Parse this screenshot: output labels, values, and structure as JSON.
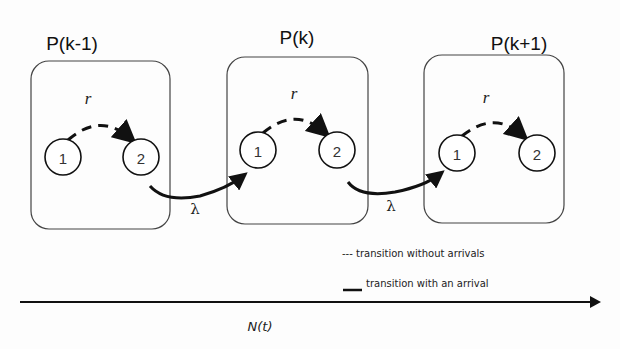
{
  "states": [
    {
      "title": "P(k-1)",
      "rate_label": "r",
      "nodes": [
        "1",
        "2"
      ]
    },
    {
      "title": "P(k)",
      "rate_label": "r",
      "nodes": [
        "1",
        "2"
      ]
    },
    {
      "title": "P(k+1)",
      "rate_label": "r",
      "nodes": [
        "1",
        "2"
      ]
    }
  ],
  "arrivals": [
    {
      "label": "λ"
    },
    {
      "label": "λ"
    }
  ],
  "legend": {
    "dashed": "--- transition without arrivals",
    "solid": "transition with an arrival"
  },
  "axis": {
    "label": "N(t)"
  }
}
